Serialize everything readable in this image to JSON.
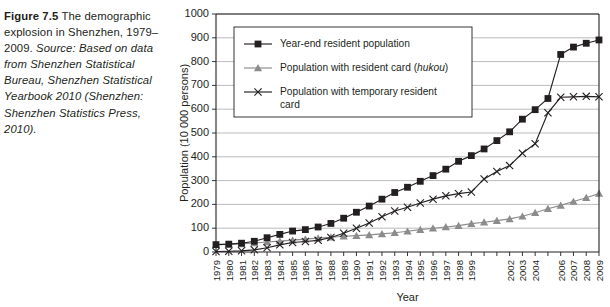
{
  "caption": {
    "figure_label": "Figure 7.5",
    "title_text": "The demographic explosion in Shenzhen, 1979–2009.",
    "source_label": "Source:",
    "source_text": "Based on data from Shenzhen Statistical Bureau, Shenzhen Statistical Yearbook 2010 (Shenzhen: Shenzhen Statistics Press, 2010)."
  },
  "colors": {
    "ink": "#231f20",
    "grid": "#a7a9ac",
    "series_resident_population": "#231f20",
    "series_hukou": "#8c8c8c",
    "series_temporary": "#231f20",
    "background": "#ffffff"
  },
  "chart_data": {
    "type": "line",
    "title": "",
    "xlabel": "Year",
    "ylabel": "Population (10 000 persons)",
    "ylim": [
      0,
      1000
    ],
    "ytick_step": 100,
    "yticks": [
      0,
      100,
      200,
      300,
      400,
      500,
      600,
      700,
      800,
      900,
      1000
    ],
    "grid": true,
    "legend_position": "upper-left-inside",
    "x": [
      1979,
      1980,
      1981,
      1982,
      1983,
      1984,
      1985,
      1986,
      1987,
      1988,
      1989,
      1990,
      1991,
      1992,
      1993,
      1994,
      1995,
      1996,
      1997,
      1998,
      1999,
      2000,
      2001,
      2002,
      2003,
      2004,
      2005,
      2006,
      2007,
      2008,
      2009
    ],
    "xtick_labels": [
      "1979",
      "1980",
      "1981",
      "1982",
      "1983",
      "1984",
      "1985",
      "1986",
      "1987",
      "1988",
      "1989",
      "1990",
      "1991",
      "1992",
      "1993",
      "1994",
      "1995",
      "1996",
      "1997",
      "1998",
      "1999",
      "",
      "",
      "2002",
      "2003",
      "2004",
      "",
      "2006",
      "2007",
      "2008",
      "2009"
    ],
    "series": [
      {
        "name": "Year-end resident population",
        "marker": "square",
        "color": "#231f20",
        "values": [
          31,
          33,
          37,
          45,
          60,
          74,
          88,
          94,
          105,
          120,
          142,
          167,
          193,
          222,
          250,
          272,
          297,
          321,
          348,
          381,
          405,
          433,
          468,
          505,
          558,
          598,
          645,
          830,
          861,
          877,
          891
        ]
      },
      {
        "name": "Population with resident card (hukou)",
        "marker": "triangle",
        "color": "#8c8c8c",
        "values": [
          31,
          32,
          34,
          38,
          42,
          46,
          50,
          54,
          58,
          62,
          66,
          69,
          72,
          76,
          81,
          87,
          94,
          100,
          105,
          111,
          119,
          125,
          132,
          139,
          150,
          165,
          182,
          196,
          212,
          228,
          246
        ]
      },
      {
        "name": "Population with temporary resident card",
        "marker": "x",
        "color": "#231f20",
        "values": [
          2,
          3,
          5,
          9,
          18,
          30,
          40,
          44,
          49,
          61,
          79,
          100,
          122,
          148,
          172,
          188,
          206,
          222,
          236,
          245,
          252,
          307,
          338,
          363,
          415,
          455,
          585,
          650,
          652,
          654,
          652
        ]
      }
    ],
    "annotations": []
  },
  "legend": {
    "items": [
      {
        "label": "Year-end resident population",
        "marker": "square"
      },
      {
        "label": "Population with resident card (",
        "italic": "hukou",
        "label_tail": ")",
        "marker": "triangle"
      },
      {
        "label_line1": "Population with temporary resident",
        "label_line2": "card",
        "marker": "x"
      }
    ]
  }
}
